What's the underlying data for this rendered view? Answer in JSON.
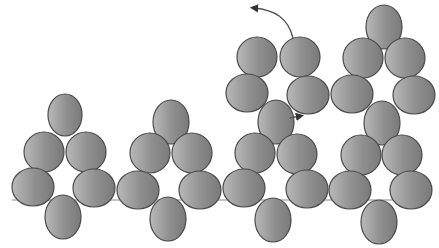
{
  "diagram": {
    "title": "Beadwork stitch diagram",
    "colors": {
      "bead_light": "#bdbdbd",
      "bead_dark": "#7d7d7d",
      "bead_outline": "#4a4a4a",
      "thread": "#8a8a8a",
      "arrow": "#555555",
      "background": "#ffffff"
    },
    "bead_radius": {
      "rx": 18,
      "ry": 17
    },
    "units": [
      {
        "name": "unit-1",
        "beads": [
          {
            "cx": 65,
            "cy": 115,
            "rx": 17,
            "ry": 21
          },
          {
            "cx": 44,
            "cy": 152,
            "rx": 20,
            "ry": 20
          },
          {
            "cx": 86,
            "cy": 152,
            "rx": 20,
            "ry": 20
          },
          {
            "cx": 33,
            "cy": 187,
            "rx": 21,
            "ry": 19
          },
          {
            "cx": 94,
            "cy": 188,
            "rx": 21,
            "ry": 19
          },
          {
            "cx": 63,
            "cy": 217,
            "rx": 18,
            "ry": 22
          }
        ]
      },
      {
        "name": "unit-2",
        "beads": [
          {
            "cx": 171,
            "cy": 122,
            "rx": 18,
            "ry": 22
          },
          {
            "cx": 150,
            "cy": 153,
            "rx": 20,
            "ry": 20
          },
          {
            "cx": 192,
            "cy": 153,
            "rx": 20,
            "ry": 20
          },
          {
            "cx": 138,
            "cy": 190,
            "rx": 21,
            "ry": 19
          },
          {
            "cx": 200,
            "cy": 190,
            "rx": 21,
            "ry": 19
          },
          {
            "cx": 168,
            "cy": 219,
            "rx": 18,
            "ry": 22
          }
        ]
      },
      {
        "name": "unit-3",
        "beads": [
          {
            "cx": 257,
            "cy": 57,
            "rx": 20,
            "ry": 20
          },
          {
            "cx": 300,
            "cy": 57,
            "rx": 20,
            "ry": 20
          },
          {
            "cx": 247,
            "cy": 93,
            "rx": 21,
            "ry": 19
          },
          {
            "cx": 308,
            "cy": 95,
            "rx": 21,
            "ry": 19
          },
          {
            "cx": 276,
            "cy": 122,
            "rx": 18,
            "ry": 22
          },
          {
            "cx": 255,
            "cy": 153,
            "rx": 20,
            "ry": 20
          },
          {
            "cx": 297,
            "cy": 154,
            "rx": 20,
            "ry": 20
          },
          {
            "cx": 244,
            "cy": 188,
            "rx": 21,
            "ry": 19
          },
          {
            "cx": 307,
            "cy": 189,
            "rx": 21,
            "ry": 19
          },
          {
            "cx": 273,
            "cy": 220,
            "rx": 18,
            "ry": 22
          }
        ]
      },
      {
        "name": "unit-4",
        "beads": [
          {
            "cx": 384,
            "cy": 27,
            "rx": 18,
            "ry": 22
          },
          {
            "cx": 363,
            "cy": 58,
            "rx": 20,
            "ry": 20
          },
          {
            "cx": 405,
            "cy": 58,
            "rx": 20,
            "ry": 20
          },
          {
            "cx": 352,
            "cy": 94,
            "rx": 21,
            "ry": 19
          },
          {
            "cx": 414,
            "cy": 95,
            "rx": 21,
            "ry": 19
          },
          {
            "cx": 382,
            "cy": 123,
            "rx": 18,
            "ry": 22
          },
          {
            "cx": 361,
            "cy": 155,
            "rx": 20,
            "ry": 20
          },
          {
            "cx": 402,
            "cy": 155,
            "rx": 20,
            "ry": 20
          },
          {
            "cx": 350,
            "cy": 190,
            "rx": 21,
            "ry": 19
          },
          {
            "cx": 411,
            "cy": 190,
            "rx": 21,
            "ry": 19
          },
          {
            "cx": 379,
            "cy": 222,
            "rx": 18,
            "ry": 22
          }
        ]
      }
    ],
    "arrows": [
      {
        "name": "arrow-curved-up-left",
        "path": "M 293 38 C 288 18, 275 10, 254 8"
      },
      {
        "name": "arrow-short-right",
        "path": "M 290 118 L 300 116"
      }
    ]
  }
}
